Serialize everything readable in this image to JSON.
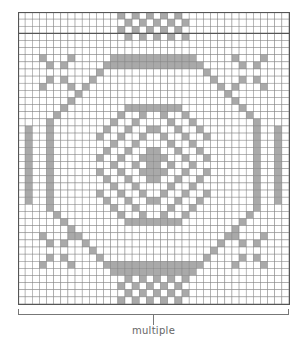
{
  "chart": {
    "columns": 38,
    "rows": 41,
    "colors": {
      "filled": "#a9a9a9",
      "empty": "#ffffff",
      "grid": "#555555"
    },
    "thick_row_line_after": 3
  },
  "bracket": {
    "label": "multiple"
  }
}
